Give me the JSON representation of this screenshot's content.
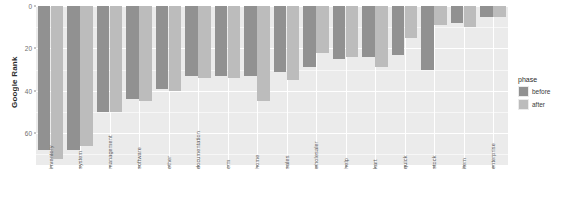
{
  "chart_data": {
    "type": "bar",
    "title": "",
    "xlabel": "",
    "ylabel": "Google Rank",
    "ylim": [
      0,
      75
    ],
    "y_reversed": true,
    "grid": true,
    "legend_position": "right",
    "legend_title": "phase",
    "y_ticks": [
      0,
      20,
      40,
      60
    ],
    "y_tick_labels": [
      "0",
      "20",
      "40",
      "60"
    ],
    "categories": [
      "inventory",
      "system",
      "management",
      "software",
      "other",
      "documentation",
      "crm",
      "home",
      "sales",
      "wholesaler",
      "help",
      "kart",
      "quick",
      "stock",
      "item",
      "enterprise"
    ],
    "series": [
      {
        "name": "before",
        "color": "#919191",
        "values": [
          68,
          68,
          50,
          44,
          39,
          33,
          33,
          33,
          31,
          29,
          25,
          24,
          23,
          30,
          8,
          5
        ]
      },
      {
        "name": "after",
        "color": "#bcbcbc",
        "values": [
          72,
          66,
          50,
          45,
          40,
          34,
          34,
          45,
          35,
          22,
          24,
          29,
          15,
          9,
          10,
          5
        ]
      }
    ]
  },
  "legend": {
    "title": "phase",
    "entries": [
      {
        "label": "before",
        "color": "#919191"
      },
      {
        "label": "after",
        "color": "#bcbcbc"
      }
    ]
  },
  "axes": {
    "y_title": "Google Rank"
  }
}
